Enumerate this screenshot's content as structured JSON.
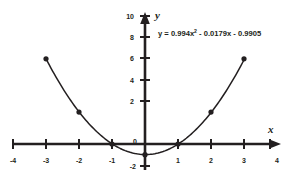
{
  "figure": {
    "title": "",
    "background_color": "#ffffff",
    "ink_color": "#231f20",
    "axis_x_label": "x",
    "axis_y_label": "y",
    "equation_label": "y = 0.994x",
    "equation_exponent": "2",
    "equation_rest": " - 0.0179x - 0.9905"
  },
  "chart_data": {
    "type": "scatter",
    "title": "",
    "xlabel": "x",
    "ylabel": "y",
    "xlim": [
      -4,
      4
    ],
    "ylim": [
      -2,
      10
    ],
    "xticks": [
      -4,
      -3,
      -2,
      -1,
      0,
      1,
      2,
      3,
      4
    ],
    "xtick_labels": [
      "-4",
      "-3",
      "-2",
      "-1",
      "0",
      "1",
      "2",
      "3",
      "4"
    ],
    "yticks": [
      -2,
      0,
      2,
      4,
      6,
      8,
      10
    ],
    "ytick_labels": [
      "-2",
      "0",
      "2",
      "4",
      "6",
      "8",
      "10"
    ],
    "grid": false,
    "legend": false,
    "origin_label": "0",
    "series": [
      {
        "name": "data points",
        "type": "scatter",
        "marker": "filled-circle",
        "color": "#231f20",
        "x": [
          -3,
          -2,
          -1,
          0,
          1,
          2,
          3
        ],
        "y": [
          8,
          3,
          0,
          -1,
          0,
          3,
          8
        ]
      },
      {
        "name": "fitted quadratic",
        "type": "line",
        "color": "#231f20",
        "equation": "y = 0.994x^2 - 0.0179x - 0.9905",
        "coefficients": {
          "a": 0.994,
          "b": -0.0179,
          "c": -0.9905
        },
        "x_range": [
          -3,
          3
        ]
      }
    ],
    "annotations": [
      {
        "text": "y = 0.994x² - 0.0179x - 0.9905",
        "x": 1.0,
        "y": 8.9
      }
    ]
  }
}
